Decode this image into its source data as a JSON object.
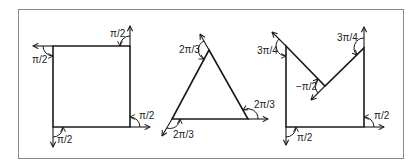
{
  "colors": {
    "background": "#ffffff",
    "frame": "#8a8a8a",
    "stroke": "#1a1a1a",
    "label": "#222222"
  },
  "frame": {
    "x": 18,
    "y": 9,
    "width": 385,
    "height": 149
  },
  "figures": [
    {
      "name": "square",
      "vertices": [
        [
          53,
          46
        ],
        [
          130,
          46
        ],
        [
          130,
          127
        ],
        [
          53,
          127
        ]
      ],
      "turn_labels": [
        {
          "text": "π/2",
          "x": 110,
          "y": 37
        },
        {
          "text": "π/2",
          "x": 32,
          "y": 63
        },
        {
          "text": "π/2",
          "x": 139,
          "y": 119
        },
        {
          "text": "π/2",
          "x": 57,
          "y": 143
        }
      ]
    },
    {
      "name": "triangle",
      "vertices": [
        [
          209,
          50
        ],
        [
          248,
          119
        ],
        [
          172,
          119
        ]
      ],
      "turn_labels": [
        {
          "text": "2π/3",
          "x": 179,
          "y": 53
        },
        {
          "text": "2π/3",
          "x": 254,
          "y": 108
        },
        {
          "text": "2π/3",
          "x": 173,
          "y": 138
        }
      ]
    },
    {
      "name": "m-shape",
      "vertices": [
        [
          286,
          46
        ],
        [
          325,
          86
        ],
        [
          364,
          48
        ],
        [
          364,
          127
        ],
        [
          286,
          127
        ]
      ],
      "turn_labels": [
        {
          "text": "3π/4",
          "x": 257,
          "y": 54
        },
        {
          "text": "3π/4",
          "x": 337,
          "y": 41
        },
        {
          "text": "−π/2",
          "x": 296,
          "y": 90
        },
        {
          "text": "π/2",
          "x": 374,
          "y": 119
        },
        {
          "text": "π/2",
          "x": 297,
          "y": 141
        }
      ]
    }
  ]
}
